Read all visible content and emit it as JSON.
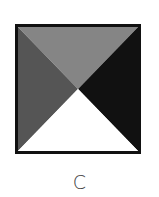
{
  "figure": {
    "label": "C",
    "shape": "square-divided-by-diagonals",
    "regions": {
      "top": {
        "color": "#858585"
      },
      "left": {
        "color": "#555555"
      },
      "right": {
        "color": "#111111"
      },
      "bottom": {
        "color": "#ffffff"
      }
    },
    "border_color": "#111111"
  }
}
